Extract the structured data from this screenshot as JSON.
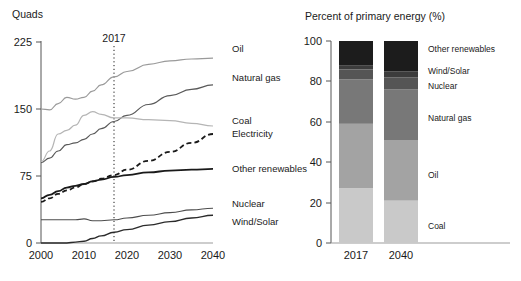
{
  "figure": {
    "left_panel": {
      "y_axis_title": "Quads",
      "y_ticks": [
        "0",
        "75",
        "150",
        "225"
      ],
      "x_ticks": [
        "2000",
        "2010",
        "2020",
        "2030",
        "2040"
      ],
      "annotation_year": "2017",
      "series_labels": {
        "oil": "Oil",
        "natural_gas": "Natural gas",
        "coal": "Coal",
        "electricity": "Electricity",
        "other_renewables": "Other renewables",
        "nuclear": "Nuclear",
        "wind_solar": "Wind/Solar"
      }
    },
    "right_panel": {
      "title": "Percent of primary energy (%)",
      "y_ticks": [
        "0",
        "20",
        "40",
        "60",
        "80",
        "100"
      ],
      "x_categories": [
        "2017",
        "2040"
      ],
      "segment_labels": {
        "other_renewables": "Other renewables",
        "wind_solar": "Wind/Solar",
        "nuclear": "Nuclear",
        "natural_gas": "Natural gas",
        "oil": "Oil",
        "coal": "Coal"
      }
    }
  },
  "chart_data": [
    {
      "type": "line",
      "title": "",
      "xlabel": "",
      "ylabel": "Quads",
      "xlim": [
        2000,
        2040
      ],
      "ylim": [
        0,
        225
      ],
      "yticks": [
        0,
        75,
        150,
        225
      ],
      "xticks": [
        2000,
        2010,
        2020,
        2030,
        2040
      ],
      "grid": false,
      "legend": "right-inline-labels",
      "annotations": [
        {
          "text": "2017",
          "x": 2017,
          "type": "vertical-dotted-line"
        }
      ],
      "x": [
        2000,
        2002,
        2004,
        2006,
        2008,
        2010,
        2012,
        2014,
        2017,
        2020,
        2025,
        2030,
        2035,
        2040
      ],
      "series": [
        {
          "name": "Oil",
          "color": "#9a9a9a",
          "style": "solid",
          "values": [
            150,
            149,
            156,
            163,
            161,
            163,
            170,
            177,
            186,
            192,
            200,
            204,
            206,
            207
          ]
        },
        {
          "name": "Natural gas",
          "color": "#5a5a5a",
          "style": "solid",
          "values": [
            90,
            95,
            103,
            110,
            112,
            116,
            122,
            128,
            136,
            143,
            155,
            165,
            172,
            177
          ]
        },
        {
          "name": "Coal",
          "color": "#b5b5b5",
          "style": "solid",
          "values": [
            91,
            103,
            122,
            126,
            132,
            143,
            147,
            144,
            140,
            140,
            138,
            137,
            134,
            131
          ]
        },
        {
          "name": "Electricity",
          "color": "#1a1a1a",
          "style": "dashed",
          "values": [
            46,
            50,
            55,
            59,
            62,
            66,
            69,
            72,
            76,
            82,
            92,
            102,
            112,
            122
          ]
        },
        {
          "name": "Other renewables",
          "color": "#1a1a1a",
          "style": "solid",
          "values": [
            50,
            54,
            58,
            62,
            64,
            66,
            69,
            71,
            74,
            76,
            79,
            81,
            82,
            83
          ]
        },
        {
          "name": "Nuclear",
          "color": "#4d4d4d",
          "style": "solid",
          "values": [
            26,
            26,
            26,
            26,
            26,
            27,
            25,
            25,
            26,
            28,
            31,
            34,
            37,
            39
          ]
        },
        {
          "name": "Wind/Solar",
          "color": "#2b2b2b",
          "style": "solid",
          "values": [
            0,
            0,
            0,
            0,
            1,
            2,
            5,
            8,
            12,
            15,
            20,
            24,
            28,
            31
          ]
        }
      ]
    },
    {
      "type": "bar",
      "subtype": "stacked",
      "title": "Percent of primary energy (%)",
      "xlabel": "",
      "ylabel": "",
      "ylim": [
        0,
        100
      ],
      "yticks": [
        0,
        20,
        40,
        60,
        80,
        100
      ],
      "grid": false,
      "categories": [
        "2017",
        "2040"
      ],
      "series": [
        {
          "name": "Coal",
          "color": "#c9c9c9",
          "values": [
            27,
            21
          ]
        },
        {
          "name": "Oil",
          "color": "#a3a3a3",
          "values": [
            32,
            30
          ]
        },
        {
          "name": "Natural gas",
          "color": "#787878",
          "values": [
            22,
            25
          ]
        },
        {
          "name": "Nuclear",
          "color": "#555555",
          "values": [
            5,
            6
          ]
        },
        {
          "name": "Wind/Solar",
          "color": "#3c3c3c",
          "values": [
            2,
            3
          ]
        },
        {
          "name": "Other renewables",
          "color": "#1c1c1c",
          "values": [
            12,
            15
          ]
        }
      ]
    }
  ]
}
